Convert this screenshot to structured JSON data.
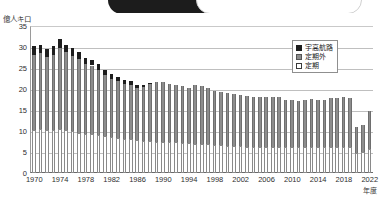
{
  "topbar": {
    "pill_label": "",
    "note": "cropped rounded toolbar element"
  },
  "chart_data": {
    "type": "bar",
    "stacked": true,
    "title": "",
    "subtitle": "",
    "unit_label": "億人キロ",
    "xlabel": "年度",
    "ylabel": "",
    "ylim": [
      0,
      35
    ],
    "ytick_step": 5,
    "yticks": [
      0,
      5,
      10,
      15,
      20,
      25,
      30,
      35
    ],
    "grid": true,
    "legend_position": "top-right",
    "x": [
      1970,
      1971,
      1972,
      1973,
      1974,
      1975,
      1976,
      1977,
      1978,
      1979,
      1980,
      1981,
      1982,
      1983,
      1984,
      1985,
      1986,
      1987,
      1988,
      1989,
      1990,
      1991,
      1992,
      1993,
      1994,
      1995,
      1996,
      1997,
      1998,
      1999,
      2000,
      2001,
      2002,
      2003,
      2004,
      2005,
      2006,
      2007,
      2008,
      2009,
      2010,
      2011,
      2012,
      2013,
      2014,
      2015,
      2016,
      2017,
      2018,
      2019,
      2020,
      2021,
      2022
    ],
    "xtick_labels": [
      "1970",
      "1974",
      "1978",
      "1982",
      "1986",
      "1990",
      "1994",
      "1998",
      "2002",
      "2006",
      "2010",
      "2014",
      "2018",
      "2022"
    ],
    "xtick_values": [
      1970,
      1974,
      1978,
      1982,
      1986,
      1990,
      1994,
      1998,
      2002,
      2006,
      2010,
      2014,
      2018,
      2022
    ],
    "categories": [
      "1970",
      "1971",
      "1972",
      "1973",
      "1974",
      "1975",
      "1976",
      "1977",
      "1978",
      "1979",
      "1980",
      "1981",
      "1982",
      "1983",
      "1984",
      "1985",
      "1986",
      "1987",
      "1988",
      "1989",
      "1990",
      "1991",
      "1992",
      "1993",
      "1994",
      "1995",
      "1996",
      "1997",
      "1998",
      "1999",
      "2000",
      "2001",
      "2002",
      "2003",
      "2004",
      "2005",
      "2006",
      "2007",
      "2008",
      "2009",
      "2010",
      "2011",
      "2012",
      "2013",
      "2014",
      "2015",
      "2016",
      "2017",
      "2018",
      "2019",
      "2020",
      "2021",
      "2022"
    ],
    "series": [
      {
        "name": "定期",
        "color": "#ffffff",
        "values": [
          10.3,
          10.4,
          10.3,
          10.2,
          10.4,
          10.2,
          9.9,
          9.6,
          9.4,
          9.2,
          9.0,
          8.7,
          8.5,
          8.3,
          8.1,
          8.0,
          7.8,
          7.7,
          7.6,
          7.5,
          7.4,
          7.4,
          7.3,
          7.2,
          7.1,
          7.0,
          6.9,
          6.8,
          6.7,
          6.6,
          6.5,
          6.4,
          6.4,
          6.3,
          6.3,
          6.3,
          6.3,
          6.3,
          6.3,
          6.2,
          6.2,
          6.1,
          6.1,
          6.2,
          6.1,
          6.1,
          6.2,
          6.2,
          6.2,
          6.2,
          4.7,
          4.9,
          5.6
        ]
      },
      {
        "name": "定期外",
        "color": "#8d8d8d",
        "values": [
          17.9,
          18.1,
          17.4,
          18.0,
          19.4,
          18.5,
          18.0,
          17.6,
          16.5,
          16.4,
          15.6,
          14.6,
          14.0,
          13.6,
          13.2,
          13.0,
          12.5,
          12.7,
          13.6,
          14.1,
          14.2,
          13.8,
          13.6,
          13.5,
          13.1,
          13.9,
          13.9,
          13.4,
          12.9,
          12.8,
          12.5,
          12.3,
          12.1,
          12.0,
          11.9,
          11.8,
          11.8,
          11.9,
          11.7,
          11.3,
          11.3,
          11.1,
          11.3,
          11.5,
          11.3,
          11.4,
          11.6,
          11.7,
          11.8,
          11.6,
          6.2,
          6.6,
          9.1
        ]
      },
      {
        "name": "宇高航路",
        "color": "#1e1e1e",
        "values": [
          2.0,
          2.1,
          1.9,
          2.0,
          2.1,
          1.9,
          1.8,
          1.7,
          1.5,
          1.4,
          1.3,
          1.2,
          1.1,
          1.0,
          0.9,
          0.8,
          0.7,
          0.6,
          0.2,
          0,
          0,
          0,
          0,
          0,
          0,
          0,
          0,
          0,
          0,
          0,
          0,
          0,
          0,
          0,
          0,
          0,
          0,
          0,
          0,
          0,
          0,
          0,
          0,
          0,
          0,
          0,
          0,
          0,
          0,
          0,
          0,
          0,
          0
        ]
      }
    ],
    "totals": [
      30.2,
      30.6,
      29.6,
      30.2,
      31.9,
      30.6,
      29.7,
      28.9,
      27.4,
      27.0,
      25.9,
      24.5,
      23.6,
      22.9,
      22.2,
      21.8,
      21.0,
      21.0,
      21.4,
      21.6,
      21.6,
      21.2,
      20.9,
      20.7,
      20.2,
      20.9,
      20.8,
      20.2,
      19.6,
      19.4,
      19.0,
      18.7,
      18.5,
      18.3,
      18.2,
      18.1,
      18.1,
      18.2,
      18.0,
      17.5,
      17.5,
      17.2,
      17.4,
      17.7,
      17.4,
      17.5,
      17.8,
      17.9,
      18.0,
      17.8,
      10.9,
      11.5,
      14.7
    ],
    "legend": [
      {
        "label": "宇高航路",
        "color": "#1e1e1e",
        "swatch": "filled-black"
      },
      {
        "label": "定期外",
        "color": "#8d8d8d",
        "swatch": "filled-gray"
      },
      {
        "label": "定期",
        "color": "#ffffff",
        "swatch": "outline-white"
      }
    ]
  }
}
